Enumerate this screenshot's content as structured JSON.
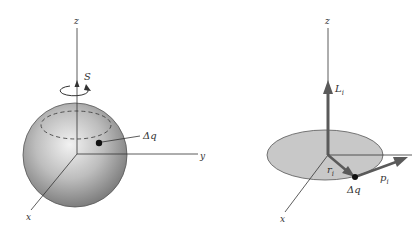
{
  "left_figure": {
    "axes": {
      "z": "z",
      "y": "y",
      "x": "x"
    },
    "spin_label": "S",
    "charge_label": "Δq",
    "colors": {
      "sphere_light": "#e6e6e6",
      "sphere_dark": "#8a8a8a",
      "axis": "#333333"
    }
  },
  "right_figure": {
    "axes": {
      "z": "z",
      "x": "x"
    },
    "angular_momentum_label": "L",
    "angular_momentum_sub": "i",
    "radius_label": "r",
    "radius_sub": "i",
    "momentum_label": "p",
    "momentum_sub": "i",
    "charge_label": "Δq",
    "colors": {
      "disk_fill": "#c8c8c8",
      "vector": "#5a5a5a",
      "axis": "#333333"
    }
  }
}
